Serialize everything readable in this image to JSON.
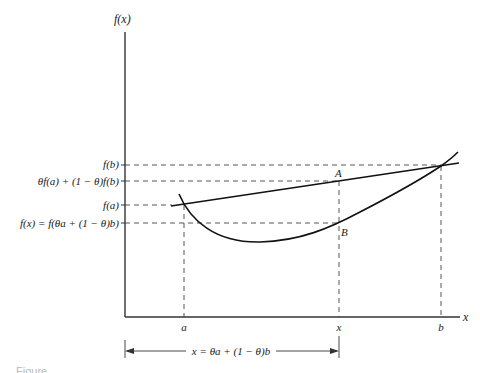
{
  "diagram": {
    "type": "convex-function-illustration",
    "axes": {
      "y_label": "f(x)",
      "x_label": "x"
    },
    "y_axis_labels": [
      {
        "id": "fb",
        "text": "f(b)"
      },
      {
        "id": "chord",
        "text": "θf(a) + (1 − θ)f(b)"
      },
      {
        "id": "fa",
        "text": "f(a)"
      },
      {
        "id": "fx",
        "text": "f(x) = f(θa + (1 − θ)b)"
      }
    ],
    "x_axis_labels": [
      {
        "id": "a",
        "text": "a"
      },
      {
        "id": "x",
        "text": "x"
      },
      {
        "id": "b",
        "text": "b"
      }
    ],
    "points": [
      {
        "id": "A",
        "text": "A"
      },
      {
        "id": "B",
        "text": "B"
      }
    ],
    "dimension_label": "x = θa + (1 − θ)b",
    "caption": "Figure"
  }
}
